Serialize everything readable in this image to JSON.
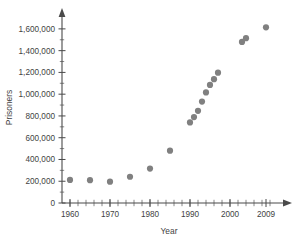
{
  "chart_data": {
    "type": "scatter",
    "title": "",
    "xlabel": "Year",
    "ylabel": "Prisoners",
    "xlim": [
      1958,
      2012
    ],
    "ylim": [
      0,
      1700000
    ],
    "grid": false,
    "legend": "none",
    "marker_color": "#808080",
    "axis_color": "#4a4a4a",
    "y_ticks": [
      0,
      200000,
      400000,
      600000,
      800000,
      1000000,
      1200000,
      1400000,
      1600000
    ],
    "y_tick_labels": [
      "0",
      "200,000",
      "400,000",
      "600,000",
      "800,000",
      "1,000,000",
      "1,200,000",
      "1,400,000",
      "1,600,000"
    ],
    "y_minor_step": 100000,
    "x_ticks": [
      1960,
      1970,
      1980,
      1990,
      2000,
      2009
    ],
    "x_tick_labels": [
      "1960",
      "1970",
      "1980",
      "1990",
      "2000",
      "2009"
    ],
    "x_minor_step": 2,
    "x": [
      1960,
      1965,
      1970,
      1975,
      1980,
      1985,
      1990,
      1991,
      1992,
      1993,
      1994,
      1995,
      1996,
      1997,
      2003,
      2004,
      2009
    ],
    "y": [
      212000,
      210000,
      196000,
      241000,
      316000,
      481000,
      740000,
      790000,
      847000,
      932000,
      1016000,
      1085000,
      1138000,
      1198000,
      1480000,
      1515000,
      1614000
    ],
    "points": [
      {
        "year": 1960,
        "prisoners": 212000
      },
      {
        "year": 1965,
        "prisoners": 210000
      },
      {
        "year": 1970,
        "prisoners": 196000
      },
      {
        "year": 1975,
        "prisoners": 241000
      },
      {
        "year": 1980,
        "prisoners": 316000
      },
      {
        "year": 1985,
        "prisoners": 481000
      },
      {
        "year": 1990,
        "prisoners": 740000
      },
      {
        "year": 1991,
        "prisoners": 790000
      },
      {
        "year": 1992,
        "prisoners": 847000
      },
      {
        "year": 1993,
        "prisoners": 932000
      },
      {
        "year": 1994,
        "prisoners": 1016000
      },
      {
        "year": 1995,
        "prisoners": 1085000
      },
      {
        "year": 1996,
        "prisoners": 1138000
      },
      {
        "year": 1997,
        "prisoners": 1198000
      },
      {
        "year": 2003,
        "prisoners": 1480000
      },
      {
        "year": 2004,
        "prisoners": 1515000
      },
      {
        "year": 2009,
        "prisoners": 1614000
      }
    ]
  }
}
